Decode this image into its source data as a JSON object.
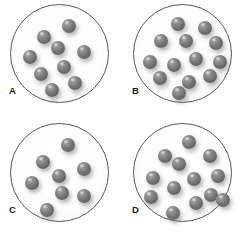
{
  "figure": {
    "title": "",
    "type": "particle-density-comparison-diagram",
    "background_color": "#ffffff",
    "vessel_outline_color": "#58585a",
    "sphere_color": "#6b6b6d",
    "sphere_highlight_color": "#b9b9bb",
    "sphere_diameter_px": 14,
    "vessel_diameter_px": 99,
    "panel_count": 4
  },
  "panels": [
    {
      "label": "A",
      "particle_count": 9,
      "particles": [
        {
          "x": 51,
          "y": 14
        },
        {
          "x": 26,
          "y": 25
        },
        {
          "x": 40,
          "y": 36
        },
        {
          "x": 12,
          "y": 45
        },
        {
          "x": 66,
          "y": 40
        },
        {
          "x": 46,
          "y": 55
        },
        {
          "x": 23,
          "y": 62
        },
        {
          "x": 57,
          "y": 71
        },
        {
          "x": 34,
          "y": 78
        }
      ]
    },
    {
      "label": "B",
      "particle_count": 13,
      "particles": [
        {
          "x": 37,
          "y": 12
        },
        {
          "x": 64,
          "y": 16
        },
        {
          "x": 20,
          "y": 29
        },
        {
          "x": 45,
          "y": 29
        },
        {
          "x": 75,
          "y": 31
        },
        {
          "x": 9,
          "y": 50
        },
        {
          "x": 33,
          "y": 53
        },
        {
          "x": 55,
          "y": 47
        },
        {
          "x": 79,
          "y": 50
        },
        {
          "x": 19,
          "y": 66
        },
        {
          "x": 48,
          "y": 70
        },
        {
          "x": 69,
          "y": 64
        },
        {
          "x": 38,
          "y": 81
        }
      ]
    },
    {
      "label": "C",
      "particle_count": 8,
      "particles": [
        {
          "x": 50,
          "y": 14
        },
        {
          "x": 25,
          "y": 31
        },
        {
          "x": 41,
          "y": 45
        },
        {
          "x": 66,
          "y": 38
        },
        {
          "x": 14,
          "y": 52
        },
        {
          "x": 44,
          "y": 62
        },
        {
          "x": 66,
          "y": 65
        },
        {
          "x": 29,
          "y": 79
        }
      ]
    },
    {
      "label": "D",
      "particle_count": 13,
      "particles": [
        {
          "x": 48,
          "y": 11
        },
        {
          "x": 24,
          "y": 25
        },
        {
          "x": 38,
          "y": 33
        },
        {
          "x": 69,
          "y": 25
        },
        {
          "x": 12,
          "y": 47
        },
        {
          "x": 53,
          "y": 48
        },
        {
          "x": 77,
          "y": 45
        },
        {
          "x": 33,
          "y": 57
        },
        {
          "x": 10,
          "y": 66
        },
        {
          "x": 70,
          "y": 64
        },
        {
          "x": 55,
          "y": 72
        },
        {
          "x": 32,
          "y": 82
        },
        {
          "x": 82,
          "y": 69
        }
      ]
    }
  ]
}
